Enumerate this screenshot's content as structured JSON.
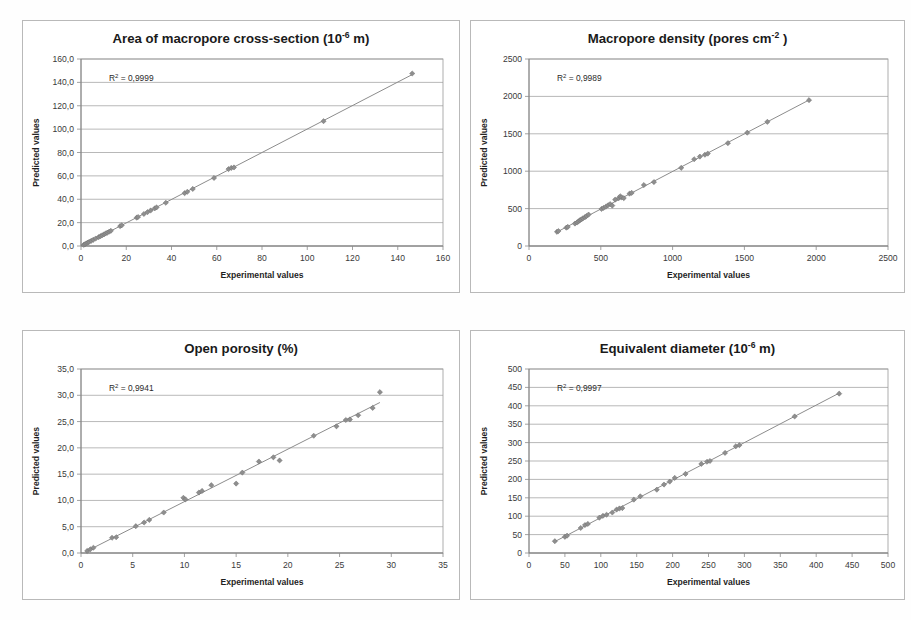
{
  "figure": {
    "layout": "2x2 grid of scatter plots",
    "background": "#fefefe",
    "marker_color": "#8e8e8e",
    "line_color": "#8c8c8c",
    "grid_color": "#9a9a9a"
  },
  "chart_data": [
    {
      "type": "scatter",
      "title": "Area of macropore cross-section (10",
      "title_sup": "-6",
      "title_tail": " m)",
      "title_full": "Area of macropore cross-section (10-6 m)",
      "xlabel": "Experimental values",
      "ylabel": "Predicted values",
      "annotation": "R² = 0,9999",
      "annotation_prefix": "R",
      "annotation_sup": "2",
      "annotation_tail": " = 0,9999",
      "r_squared": "0,9999",
      "xlim": [
        0,
        160
      ],
      "ylim": [
        0,
        160
      ],
      "xticks": [
        0,
        20,
        40,
        60,
        80,
        100,
        120,
        140,
        160
      ],
      "yticks": [
        0,
        20,
        40,
        60,
        80,
        100,
        120,
        140,
        160
      ],
      "xticklabels": [
        "0",
        "20",
        "40",
        "60",
        "80",
        "100",
        "120",
        "140",
        "160"
      ],
      "yticklabels": [
        "0,0",
        "20,0",
        "40,0",
        "60,0",
        "80,0",
        "100,0",
        "120,0",
        "140,0",
        "160,0"
      ],
      "grid": "horizontal",
      "legend": "none",
      "x": [
        1.2,
        1.8,
        2.4,
        3.0,
        3.6,
        4.5,
        5.4,
        6.5,
        7.8,
        8.6,
        9.4,
        10.2,
        10.9,
        11.6,
        12.4,
        13.2,
        17.3,
        18.0,
        24.6,
        25.2,
        27.8,
        29.4,
        30.8,
        32.6,
        33.4,
        37.5,
        45.8,
        47.0,
        49.4,
        58.8,
        65.2,
        66.4,
        67.6,
        107.2,
        146.4
      ],
      "y": [
        1.0,
        1.6,
        2.2,
        2.9,
        3.5,
        4.4,
        5.3,
        6.4,
        7.6,
        8.4,
        9.2,
        10.0,
        10.7,
        11.4,
        12.2,
        13.0,
        17.0,
        17.7,
        24.2,
        24.8,
        27.4,
        29.0,
        30.4,
        32.2,
        33.0,
        37.0,
        45.2,
        46.4,
        48.8,
        58.2,
        65.8,
        66.8,
        67.2,
        106.8,
        147.6
      ]
    },
    {
      "type": "scatter",
      "title": "Macropore density (pores cm",
      "title_sup": "-2",
      "title_tail": " )",
      "title_full": "Macropore density (pores cm-2 )",
      "xlabel": "Experimental values",
      "ylabel": "Predicted values",
      "annotation": "R² = 0,9989",
      "annotation_prefix": "R",
      "annotation_sup": "2",
      "annotation_tail": " = 0,9989",
      "r_squared": "0,9989",
      "xlim": [
        0,
        2500
      ],
      "ylim": [
        0,
        2500
      ],
      "xticks": [
        0,
        500,
        1000,
        1500,
        2000,
        2500
      ],
      "yticks": [
        0,
        500,
        1000,
        1500,
        2000,
        2500
      ],
      "xticklabels": [
        "0",
        "500",
        "1000",
        "1500",
        "2000",
        "2500"
      ],
      "yticklabels": [
        "0",
        "500",
        "1000",
        "1500",
        "2000",
        "2500"
      ],
      "grid": "horizontal",
      "legend": "none",
      "x": [
        195,
        205,
        260,
        270,
        320,
        335,
        345,
        355,
        365,
        375,
        390,
        400,
        415,
        505,
        520,
        535,
        550,
        565,
        580,
        600,
        625,
        635,
        645,
        660,
        700,
        715,
        800,
        870,
        1060,
        1150,
        1190,
        1225,
        1245,
        1385,
        1520,
        1660,
        1950
      ],
      "y": [
        190,
        200,
        245,
        255,
        300,
        315,
        330,
        345,
        355,
        370,
        385,
        400,
        420,
        495,
        510,
        525,
        545,
        560,
        540,
        620,
        640,
        665,
        650,
        640,
        700,
        710,
        815,
        855,
        1045,
        1160,
        1195,
        1220,
        1235,
        1375,
        1515,
        1660,
        1950
      ]
    },
    {
      "type": "scatter",
      "title": "Open porosity (%)",
      "title_sup": "",
      "title_tail": "",
      "title_full": "Open porosity (%)",
      "xlabel": "Experimental values",
      "ylabel": "Predicted values",
      "annotation": "R² = 0,9941",
      "annotation_prefix": "R",
      "annotation_sup": "2",
      "annotation_tail": " = 0,9941",
      "r_squared": "0,9941",
      "xlim": [
        0,
        35
      ],
      "ylim": [
        0,
        35
      ],
      "xticks": [
        0,
        5,
        10,
        15,
        20,
        25,
        30,
        35
      ],
      "yticks": [
        0,
        5,
        10,
        15,
        20,
        25,
        30,
        35
      ],
      "xticklabels": [
        "0",
        "5",
        "10",
        "15",
        "20",
        "25",
        "30",
        "35"
      ],
      "yticklabels": [
        "0,0",
        "5,0",
        "10,0",
        "15,0",
        "20,0",
        "25,0",
        "30,0",
        "35,0"
      ],
      "grid": "horizontal",
      "legend": "none",
      "x": [
        0.6,
        0.9,
        1.2,
        3.0,
        3.4,
        5.3,
        6.1,
        6.6,
        8.0,
        9.9,
        10.1,
        11.4,
        11.7,
        12.6,
        15.0,
        15.6,
        17.2,
        18.6,
        19.2,
        22.5,
        24.7,
        25.6,
        26.0,
        26.8,
        28.2,
        28.9
      ],
      "y": [
        0.4,
        0.7,
        1.0,
        2.9,
        3.0,
        5.1,
        5.8,
        6.3,
        7.7,
        10.5,
        10.2,
        11.5,
        11.8,
        12.9,
        13.2,
        15.3,
        17.4,
        18.2,
        17.6,
        22.3,
        24.1,
        25.3,
        25.4,
        26.2,
        27.6,
        30.6
      ]
    },
    {
      "type": "scatter",
      "title": "Equivalent diameter (10",
      "title_sup": "-6",
      "title_tail": "  m)",
      "title_full": "Equivalent diameter (10-6  m)",
      "xlabel": "Experimental values",
      "ylabel": "Predicted values",
      "annotation": "R² = 0,9997",
      "annotation_prefix": "R",
      "annotation_sup": "2",
      "annotation_tail": " = 0,9997",
      "r_squared": "0,9997",
      "xlim": [
        0,
        500
      ],
      "ylim": [
        0,
        500
      ],
      "xticks": [
        0,
        50,
        100,
        150,
        200,
        250,
        300,
        350,
        400,
        450,
        500
      ],
      "yticks": [
        0,
        50,
        100,
        150,
        200,
        250,
        300,
        350,
        400,
        450,
        500
      ],
      "xticklabels": [
        "0",
        "50",
        "100",
        "150",
        "200",
        "250",
        "300",
        "350",
        "400",
        "450",
        "500"
      ],
      "yticklabels": [
        "0",
        "50",
        "100",
        "150",
        "200",
        "250",
        "300",
        "350",
        "400",
        "450",
        "500"
      ],
      "grid": "horizontal",
      "legend": "none",
      "x": [
        36,
        50,
        53,
        72,
        78,
        82,
        98,
        103,
        108,
        116,
        122,
        126,
        130,
        146,
        155,
        178,
        188,
        196,
        203,
        218,
        240,
        248,
        252,
        273,
        288,
        293,
        370,
        432
      ],
      "y": [
        32,
        44,
        47,
        68,
        76,
        79,
        96,
        101,
        104,
        110,
        118,
        121,
        122,
        145,
        154,
        172,
        186,
        194,
        204,
        215,
        242,
        248,
        250,
        272,
        290,
        293,
        371,
        433
      ]
    }
  ]
}
